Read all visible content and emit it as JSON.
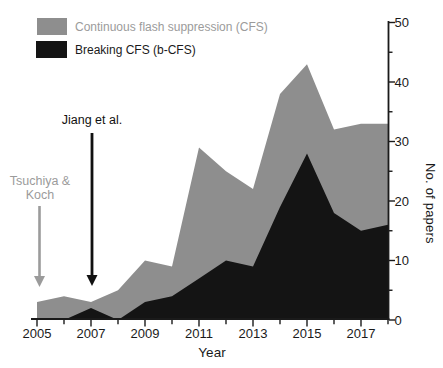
{
  "chart_data": {
    "type": "area",
    "mode": "overlay-black-in-front-of-gray",
    "x_years": [
      2005,
      2006,
      2007,
      2008,
      2009,
      2010,
      2011,
      2012,
      2013,
      2014,
      2015,
      2016,
      2017,
      2018
    ],
    "series": [
      {
        "name": "Continuous flash suppression (CFS)",
        "color": "#8e8e8e",
        "values": [
          3,
          4,
          3,
          5,
          10,
          9,
          29,
          25,
          22,
          38,
          43,
          32,
          33,
          33
        ]
      },
      {
        "name": "Breaking CFS (b-CFS)",
        "color": "#141414",
        "values": [
          0,
          0,
          2,
          0,
          3,
          4,
          7,
          10,
          9,
          19,
          28,
          18,
          15,
          16
        ]
      }
    ],
    "xlabel": "Year",
    "ylabel": "No. of papers",
    "xlim": [
      2005,
      2018
    ],
    "ylim": [
      0,
      50
    ],
    "x_labeled_ticks": [
      2005,
      2007,
      2009,
      2011,
      2013,
      2015,
      2017
    ],
    "x_minor_step": 1,
    "y_major_step": 10,
    "y_minor_step": 5,
    "y_axis_side": "right",
    "grid": false,
    "legend_position": "top-left"
  },
  "legend": {
    "items": [
      {
        "label": "Continuous flash suppression (CFS)",
        "swatch_color": "#8e8e8e",
        "text_color": "#9b9b9b"
      },
      {
        "label": "Breaking CFS (b-CFS)",
        "swatch_color": "#141414",
        "text_color": "#1a1a1a"
      }
    ]
  },
  "annotations": [
    {
      "text": "Tsuchiya &\nKoch",
      "target_year": 2005,
      "color": "#9b9b9b"
    },
    {
      "text": "Jiang et al.",
      "target_year": 2007,
      "color": "#111111"
    }
  ],
  "axes": {
    "x_label": "Year",
    "y_label": "No. of papers",
    "axis_color": "#1a1a1a"
  }
}
